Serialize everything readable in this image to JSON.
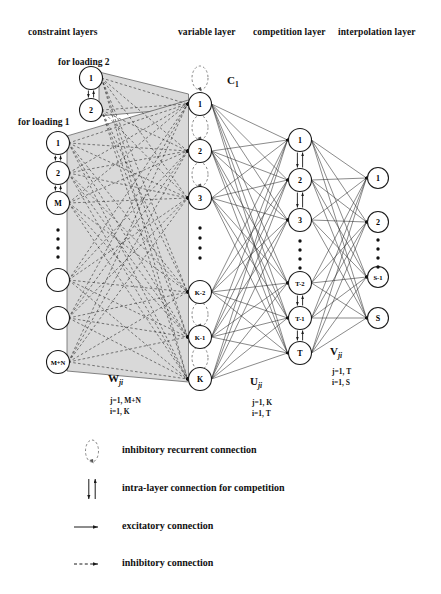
{
  "figure": {
    "type": "neural-network-architecture-diagram",
    "width": 441,
    "height": 594
  },
  "headers": [
    {
      "id": "constraint",
      "label": "constraint layers",
      "x": 28,
      "y": 27
    },
    {
      "id": "variable",
      "label": "variable layer",
      "x": 178,
      "y": 27
    },
    {
      "id": "competition",
      "label": "competition layer",
      "x": 253,
      "y": 27
    },
    {
      "id": "interpolation",
      "label": "interpolation layer",
      "x": 338,
      "y": 27
    }
  ],
  "group_labels": [
    {
      "id": "loading2",
      "label": "for loading 2",
      "x": 58,
      "y": 57
    },
    {
      "id": "loading1",
      "label": "for loading 1",
      "x": 18,
      "y": 117
    }
  ],
  "layers": {
    "constraint_loading2": {
      "name": "constraint layer for loading 2",
      "x": 91,
      "nodes": [
        {
          "label": "1",
          "y": 78
        },
        {
          "label": "2",
          "y": 110
        }
      ]
    },
    "constraint_loading1": {
      "name": "constraint layer for loading 1",
      "x": 58,
      "nodes": [
        {
          "label": "1",
          "y": 143
        },
        {
          "label": "2",
          "y": 173
        },
        {
          "label": "M",
          "y": 203
        },
        {
          "label": "",
          "y": 280
        },
        {
          "label": "",
          "y": 318
        },
        {
          "label": "M+N",
          "y": 362
        }
      ],
      "ellipsis": {
        "x": 58,
        "y_start": 230,
        "count": 4,
        "gap": 9
      }
    },
    "variable": {
      "name": "variable layer",
      "x": 200,
      "nodes": [
        {
          "label": "1",
          "y": 104
        },
        {
          "label": "2",
          "y": 151
        },
        {
          "label": "3",
          "y": 198
        },
        {
          "label": "K-2",
          "y": 292
        },
        {
          "label": "K-1",
          "y": 337
        },
        {
          "label": "K",
          "y": 379
        }
      ],
      "ellipsis": {
        "x": 200,
        "y_start": 228,
        "count": 4,
        "gap": 10
      }
    },
    "competition": {
      "name": "competition layer",
      "x": 300,
      "nodes": [
        {
          "label": "1",
          "y": 140
        },
        {
          "label": "2",
          "y": 180
        },
        {
          "label": "3",
          "y": 220
        },
        {
          "label": "T-2",
          "y": 283
        },
        {
          "label": "T-1",
          "y": 318
        },
        {
          "label": "T",
          "y": 353
        }
      ],
      "ellipsis": {
        "x": 300,
        "y_start": 241,
        "count": 4,
        "gap": 9
      }
    },
    "interpolation": {
      "name": "interpolation layer",
      "x": 378,
      "nodes": [
        {
          "label": "1",
          "y": 178
        },
        {
          "label": "2",
          "y": 222
        },
        {
          "label": "S-1",
          "y": 277
        },
        {
          "label": "S",
          "y": 318
        }
      ],
      "ellipsis": {
        "x": 378,
        "y_start": 240,
        "count": 4,
        "gap": 9
      }
    }
  },
  "recurrent_label": {
    "symbol": "C",
    "subscript": "1",
    "x": 227,
    "y": 74
  },
  "weight_labels": [
    {
      "id": "W",
      "symbol": "W",
      "subscript": "ji",
      "x": 108,
      "y": 372,
      "indices": [
        "j=1, M+N",
        "i=1, K"
      ],
      "index_x": 110,
      "index_y": 396
    },
    {
      "id": "U",
      "symbol": "U",
      "subscript": "ji",
      "x": 250,
      "y": 375,
      "indices": [
        "j=1, K",
        "i=1, T"
      ],
      "index_x": 252,
      "index_y": 398
    },
    {
      "id": "V",
      "symbol": "V",
      "subscript": "ji",
      "x": 330,
      "y": 345,
      "indices": [
        "j=1, T",
        "i=1, S"
      ],
      "index_x": 332,
      "index_y": 367
    }
  ],
  "legend": [
    {
      "id": "inhibitory-recurrent",
      "label": "inhibitory recurrent connection",
      "icon": "dashed-loop",
      "y": 451
    },
    {
      "id": "intra-layer",
      "label": "intra-layer connection for competition",
      "icon": "double-arrow",
      "y": 489
    },
    {
      "id": "excitatory",
      "label": "excitatory connection",
      "icon": "solid-arrow",
      "y": 527
    },
    {
      "id": "inhibitory",
      "label": "inhibitory connection",
      "icon": "dashed-arrow",
      "y": 564
    }
  ],
  "colors": {
    "shade": "#d9d9d9",
    "stroke": "#1a1a1a",
    "node_fill": "#ffffff",
    "text": "#111111"
  }
}
